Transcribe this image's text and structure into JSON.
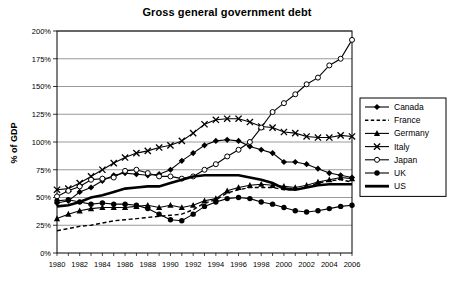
{
  "chart_data": {
    "type": "line",
    "title": "Gross general government debt",
    "xlabel": "",
    "ylabel": "% of GDP",
    "ylim": [
      0,
      200
    ],
    "ytick_step": 25,
    "ytick_labels": [
      "0%",
      "25%",
      "50%",
      "75%",
      "100%",
      "125%",
      "150%",
      "175%",
      "200%"
    ],
    "ytick_values": [
      0,
      25,
      50,
      75,
      100,
      125,
      150,
      175,
      200
    ],
    "grid": true,
    "legend_position": "right",
    "x": [
      1980,
      1981,
      1982,
      1983,
      1984,
      1985,
      1986,
      1987,
      1988,
      1989,
      1990,
      1991,
      1992,
      1993,
      1994,
      1995,
      1996,
      1997,
      1998,
      1999,
      2000,
      2001,
      2002,
      2003,
      2004,
      2005,
      2006
    ],
    "xtick_labels": [
      "1980",
      "1982",
      "1984",
      "1986",
      "1988",
      "1990",
      "1992",
      "1994",
      "1996",
      "1998",
      "2000",
      "2002",
      "2004",
      "2006"
    ],
    "xtick_values": [
      1980,
      1982,
      1984,
      1986,
      1988,
      1990,
      1992,
      1994,
      1996,
      1998,
      2000,
      2002,
      2004,
      2006
    ],
    "series": [
      {
        "name": "Canada",
        "marker": "diamond",
        "dash": "solid",
        "color": "#000000",
        "values": [
          45,
          47,
          55,
          59,
          65,
          70,
          72,
          71,
          70,
          71,
          75,
          83,
          90,
          97,
          101,
          102,
          101,
          96,
          93,
          90,
          82,
          82,
          80,
          76,
          72,
          70,
          68
        ]
      },
      {
        "name": "France",
        "marker": "none",
        "dash": "dashed",
        "color": "#000000",
        "values": [
          20,
          22,
          24,
          25,
          27,
          29,
          30,
          31,
          32,
          33,
          34,
          35,
          39,
          45,
          48,
          54,
          57,
          59,
          59,
          59,
          57,
          57,
          59,
          63,
          65,
          66,
          64
        ]
      },
      {
        "name": "Germany",
        "marker": "triangle",
        "dash": "solid",
        "color": "#000000",
        "values": [
          31,
          35,
          38,
          40,
          41,
          41,
          41,
          42,
          43,
          41,
          43,
          41,
          43,
          47,
          49,
          56,
          59,
          61,
          62,
          61,
          60,
          59,
          61,
          64,
          66,
          68,
          67
        ]
      },
      {
        "name": "Italy",
        "marker": "cross",
        "dash": "solid",
        "color": "#000000",
        "values": [
          57,
          58,
          63,
          69,
          75,
          81,
          86,
          90,
          92,
          95,
          97,
          101,
          108,
          116,
          120,
          121,
          121,
          118,
          114,
          113,
          109,
          108,
          105,
          104,
          104,
          106,
          105
        ]
      },
      {
        "name": "Japan",
        "marker": "circle-open",
        "dash": "solid",
        "color": "#000000",
        "values": [
          51,
          56,
          60,
          66,
          67,
          68,
          74,
          75,
          72,
          69,
          69,
          67,
          69,
          75,
          80,
          87,
          93,
          100,
          113,
          127,
          135,
          143,
          152,
          158,
          169,
          175,
          192
        ]
      },
      {
        "name": "UK",
        "marker": "circle-filled",
        "dash": "solid",
        "color": "#000000",
        "values": [
          47,
          48,
          46,
          44,
          45,
          44,
          44,
          43,
          40,
          35,
          30,
          29,
          35,
          42,
          46,
          49,
          50,
          49,
          46,
          44,
          41,
          38,
          37,
          38,
          40,
          42,
          43
        ]
      },
      {
        "name": "US",
        "marker": "none",
        "dash": "thick",
        "color": "#000000",
        "values": [
          42,
          43,
          46,
          50,
          52,
          55,
          58,
          59,
          60,
          60,
          63,
          66,
          69,
          70,
          70,
          70,
          70,
          68,
          66,
          63,
          58,
          57,
          59,
          61,
          62,
          62,
          62
        ]
      }
    ]
  },
  "legend": {
    "entries": [
      "Canada",
      "France",
      "Germany",
      "Italy",
      "Japan",
      "UK",
      "US"
    ]
  }
}
